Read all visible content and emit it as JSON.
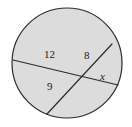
{
  "figure": {
    "name": "circle-with-two-intersecting-chords",
    "width": 132,
    "height": 127,
    "background_color": "#ffffff"
  },
  "circle": {
    "center_x": 67,
    "center_y": 63,
    "radius": 55,
    "fill_color": "#dcdcdc",
    "stroke_color": "#2b2b2b",
    "stroke_width": 1.2
  },
  "chords": [
    {
      "name": "chord-long",
      "from_x": 13,
      "from_y": 60,
      "to_x": 118,
      "to_y": 85,
      "stroke_color": "#2b2b2b",
      "stroke_width": 1.2,
      "segments": [
        "12",
        "x"
      ]
    },
    {
      "name": "chord-short",
      "from_x": 47,
      "from_y": 114,
      "to_x": 112,
      "to_y": 44,
      "stroke_color": "#2b2b2b",
      "stroke_width": 1.2,
      "segments": [
        "9",
        "8"
      ]
    }
  ],
  "intersection": {
    "x": 78,
    "y": 75
  },
  "labels": {
    "twelve": "12",
    "eight": "8",
    "nine": "9",
    "x": "x"
  }
}
